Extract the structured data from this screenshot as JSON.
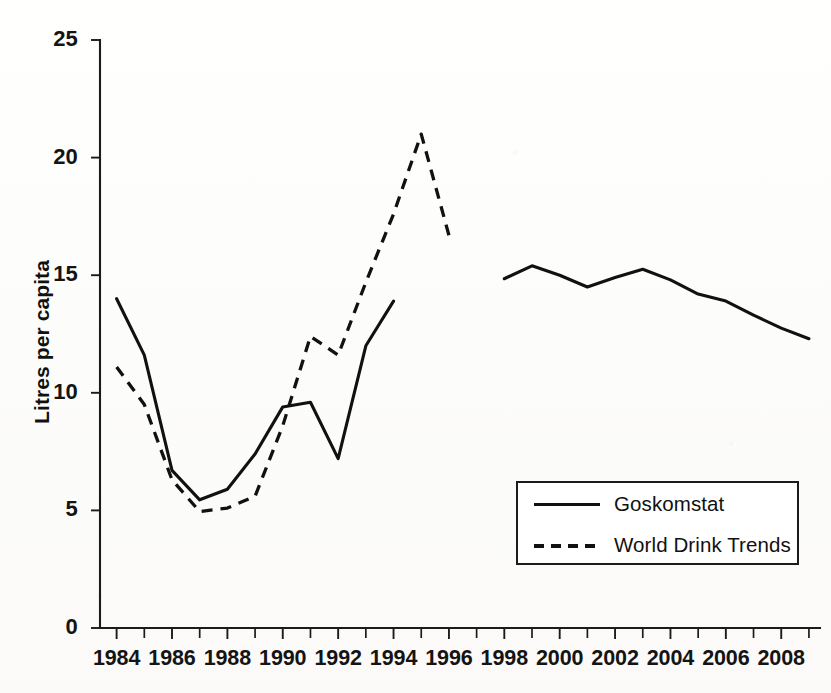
{
  "chart_data": {
    "type": "line",
    "title": "",
    "xlabel": "",
    "ylabel": "Litres per capita",
    "xlim": [
      1983.4,
      2009.4
    ],
    "ylim": [
      0,
      25
    ],
    "yticks": [
      0,
      5,
      10,
      15,
      20,
      25
    ],
    "ytick_labels": [
      "0",
      "5",
      "10",
      "15",
      "20",
      "25"
    ],
    "xticks": [
      1984,
      1986,
      1988,
      1990,
      1992,
      1994,
      1996,
      1998,
      2000,
      2002,
      2004,
      2006,
      2008
    ],
    "xtick_labels": [
      "1984",
      "1986",
      "1988",
      "1990",
      "1992",
      "1994",
      "1996",
      "1998",
      "2000",
      "2002",
      "2004",
      "2006",
      "2008"
    ],
    "minor_xticks_every": 1,
    "grid": false,
    "legend_position": "lower right",
    "series": [
      {
        "name": "Goskomstat",
        "style": "solid",
        "color": "#111111",
        "segments": [
          {
            "x": [
              1984,
              1985,
              1986,
              1987,
              1988,
              1989,
              1990,
              1991,
              1992,
              1993,
              1994
            ],
            "y": [
              14.0,
              11.6,
              6.7,
              5.45,
              5.9,
              7.4,
              9.4,
              9.6,
              7.2,
              12.0,
              13.9
            ]
          },
          {
            "x": [
              1998,
              1999,
              2000,
              2001,
              2002,
              2003,
              2004,
              2005,
              2006,
              2007,
              2008,
              2009
            ],
            "y": [
              14.85,
              15.4,
              15.0,
              14.5,
              14.9,
              15.25,
              14.8,
              14.2,
              13.9,
              13.3,
              12.75,
              12.3
            ]
          }
        ]
      },
      {
        "name": "World Drink Trends",
        "style": "dashed",
        "color": "#111111",
        "segments": [
          {
            "x": [
              1984,
              1985,
              1986,
              1987,
              1988,
              1989,
              1990,
              1991,
              1992,
              1993,
              1994,
              1995,
              1996
            ],
            "y": [
              11.1,
              9.5,
              6.3,
              4.95,
              5.1,
              5.6,
              8.6,
              12.4,
              11.6,
              14.7,
              17.6,
              21.0,
              16.7
            ]
          }
        ]
      }
    ]
  },
  "legend": {
    "entries": [
      {
        "label": "Goskomstat",
        "style": "solid"
      },
      {
        "label": "World Drink Trends",
        "style": "dashed"
      }
    ]
  }
}
